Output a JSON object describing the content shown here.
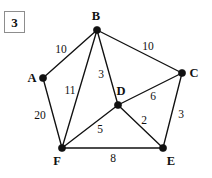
{
  "figure": {
    "number_label": "3"
  },
  "graph": {
    "title": "Weighted undirected graph",
    "node_color": "#111111",
    "edge_color": "#111111",
    "background_color": "#ffffff",
    "nodes": [
      {
        "id": "A",
        "label": "A",
        "x": 43,
        "y": 78,
        "label_x": 32,
        "label_y": 78
      },
      {
        "id": "B",
        "label": "B",
        "x": 97,
        "y": 30,
        "label_x": 96,
        "label_y": 16
      },
      {
        "id": "C",
        "label": "C",
        "x": 182,
        "y": 73,
        "label_x": 194,
        "label_y": 73
      },
      {
        "id": "D",
        "label": "D",
        "x": 118,
        "y": 105,
        "label_x": 121,
        "label_y": 91
      },
      {
        "id": "E",
        "label": "E",
        "x": 163,
        "y": 148,
        "label_x": 171,
        "label_y": 161
      },
      {
        "id": "F",
        "label": "F",
        "x": 62,
        "y": 148,
        "label_x": 57,
        "label_y": 161
      }
    ],
    "edges": [
      {
        "from": "A",
        "to": "B",
        "weight": "10",
        "label_x": 61,
        "label_y": 50
      },
      {
        "from": "B",
        "to": "C",
        "weight": "10",
        "label_x": 148,
        "label_y": 47
      },
      {
        "from": "B",
        "to": "D",
        "weight": "3",
        "label_x": 101,
        "label_y": 75
      },
      {
        "from": "B",
        "to": "F",
        "weight": "11",
        "label_x": 70,
        "label_y": 91
      },
      {
        "from": "A",
        "to": "F",
        "weight": "20",
        "label_x": 40,
        "label_y": 116
      },
      {
        "from": "D",
        "to": "C",
        "weight": "6",
        "label_x": 153,
        "label_y": 97
      },
      {
        "from": "C",
        "to": "E",
        "weight": "3",
        "label_x": 181,
        "label_y": 115
      },
      {
        "from": "D",
        "to": "E",
        "weight": "2",
        "label_x": 144,
        "label_y": 121
      },
      {
        "from": "F",
        "to": "D",
        "weight": "5",
        "label_x": 100,
        "label_y": 130
      },
      {
        "from": "F",
        "to": "E",
        "weight": "8",
        "label_x": 113,
        "label_y": 159
      }
    ]
  }
}
